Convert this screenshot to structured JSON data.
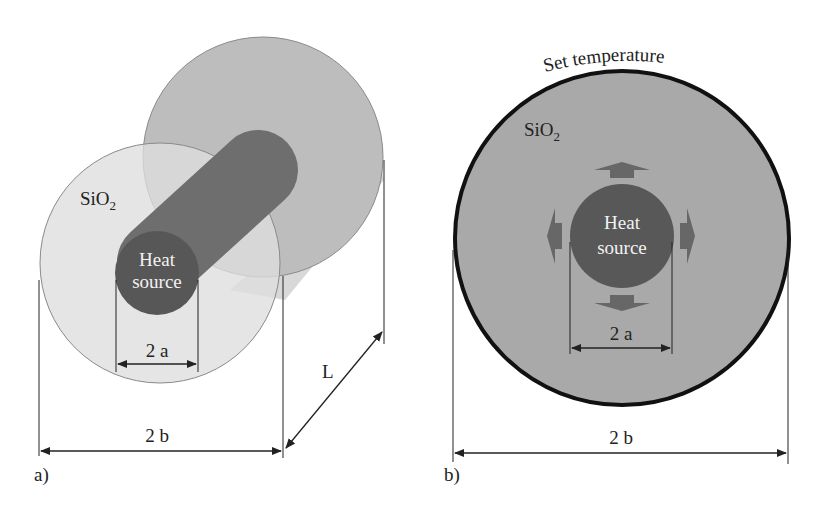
{
  "panel_a": {
    "label": "a)",
    "material_label": "SiO",
    "material_subscript": "2",
    "heat_source_line1": "Heat",
    "heat_source_line2": "source",
    "inner_dim": "2 a",
    "outer_dim": "2 b",
    "length_dim": "L"
  },
  "panel_b": {
    "label": "b)",
    "boundary_label": "Set temperature",
    "material_label": "SiO",
    "material_subscript": "2",
    "heat_source_line1": "Heat",
    "heat_source_line2": "source",
    "inner_dim": "2 a",
    "outer_dim": "2 b"
  },
  "colors": {
    "front_disc": "#dcdcdc",
    "back_disc": "#b9b9b9",
    "shadow_band": "#e6e6e6",
    "rod": "#6f6f6f",
    "heat_source": "#5a5a5a",
    "cross_section": "#a7a7a7",
    "boundary": "#111111",
    "arrows": "#6a6a6a"
  }
}
